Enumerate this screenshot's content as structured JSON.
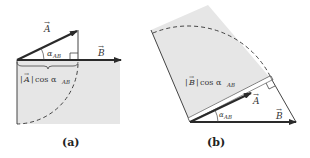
{
  "panels": [
    {
      "caption": "(a)",
      "labels": {
        "vector_a": "A",
        "vector_b": "B",
        "angle": "α",
        "angle_sub": "AB",
        "projection_text": "cos α",
        "projection_sub": "AB",
        "projection_magnitude": "A"
      }
    },
    {
      "caption": "(b)",
      "labels": {
        "vector_a": "A",
        "vector_b": "B",
        "angle": "α",
        "angle_sub": "AB",
        "projection_text": "cos α",
        "projection_sub": "AB",
        "projection_magnitude": "B"
      }
    }
  ],
  "colors": {
    "shade": "#e6e6e6",
    "vector": "#2a2a2a"
  }
}
